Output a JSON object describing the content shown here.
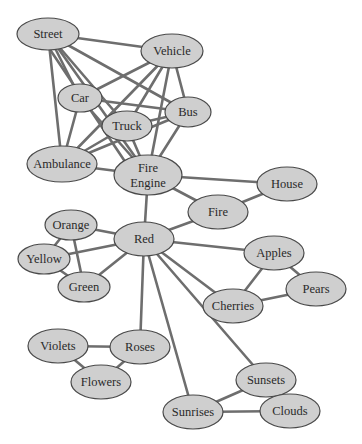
{
  "diagram": {
    "type": "semantic-network",
    "node_fill": "#cfcfcf",
    "node_stroke": "#4a4a4a",
    "edge_color": "#6e6e6e",
    "nodes": [
      {
        "id": "street",
        "label": [
          "Street"
        ],
        "cx": 48,
        "cy": 34,
        "rx": 31,
        "ry": 16
      },
      {
        "id": "vehicle",
        "label": [
          "Vehicle"
        ],
        "cx": 172,
        "cy": 51,
        "rx": 31,
        "ry": 17
      },
      {
        "id": "car",
        "label": [
          "Car"
        ],
        "cx": 80,
        "cy": 98,
        "rx": 22,
        "ry": 14
      },
      {
        "id": "bus",
        "label": [
          "Bus"
        ],
        "cx": 188,
        "cy": 112,
        "rx": 23,
        "ry": 15
      },
      {
        "id": "truck",
        "label": [
          "Truck"
        ],
        "cx": 127,
        "cy": 126,
        "rx": 25,
        "ry": 15
      },
      {
        "id": "ambulance",
        "label": [
          "Ambulance"
        ],
        "cx": 62,
        "cy": 164,
        "rx": 35,
        "ry": 18
      },
      {
        "id": "fire-engine",
        "label": [
          "Fire",
          "Engine"
        ],
        "cx": 148,
        "cy": 175,
        "rx": 34,
        "ry": 20
      },
      {
        "id": "house",
        "label": [
          "House"
        ],
        "cx": 287,
        "cy": 184,
        "rx": 30,
        "ry": 17
      },
      {
        "id": "fire",
        "label": [
          "Fire"
        ],
        "cx": 218,
        "cy": 212,
        "rx": 30,
        "ry": 17
      },
      {
        "id": "orange",
        "label": [
          "Orange"
        ],
        "cx": 71,
        "cy": 225,
        "rx": 26,
        "ry": 15
      },
      {
        "id": "red",
        "label": [
          "Red"
        ],
        "cx": 144,
        "cy": 239,
        "rx": 30,
        "ry": 17
      },
      {
        "id": "yellow",
        "label": [
          "Yellow"
        ],
        "cx": 44,
        "cy": 259,
        "rx": 26,
        "ry": 15
      },
      {
        "id": "green",
        "label": [
          "Green"
        ],
        "cx": 84,
        "cy": 287,
        "rx": 26,
        "ry": 15
      },
      {
        "id": "apples",
        "label": [
          "Apples"
        ],
        "cx": 274,
        "cy": 253,
        "rx": 30,
        "ry": 17
      },
      {
        "id": "pears",
        "label": [
          "Pears"
        ],
        "cx": 316,
        "cy": 289,
        "rx": 30,
        "ry": 17
      },
      {
        "id": "cherries",
        "label": [
          "Cherries"
        ],
        "cx": 233,
        "cy": 306,
        "rx": 30,
        "ry": 17
      },
      {
        "id": "violets",
        "label": [
          "Violets"
        ],
        "cx": 58,
        "cy": 346,
        "rx": 30,
        "ry": 17
      },
      {
        "id": "roses",
        "label": [
          "Roses"
        ],
        "cx": 140,
        "cy": 347,
        "rx": 30,
        "ry": 17
      },
      {
        "id": "flowers",
        "label": [
          "Flowers"
        ],
        "cx": 101,
        "cy": 382,
        "rx": 30,
        "ry": 17
      },
      {
        "id": "sunsets",
        "label": [
          "Sunsets"
        ],
        "cx": 266,
        "cy": 380,
        "rx": 30,
        "ry": 17
      },
      {
        "id": "sunrises",
        "label": [
          "Sunrises"
        ],
        "cx": 193,
        "cy": 412,
        "rx": 30,
        "ry": 17
      },
      {
        "id": "clouds",
        "label": [
          "Clouds"
        ],
        "cx": 290,
        "cy": 411,
        "rx": 30,
        "ry": 17
      }
    ],
    "edges": [
      [
        "street",
        "vehicle"
      ],
      [
        "street",
        "car"
      ],
      [
        "street",
        "bus"
      ],
      [
        "street",
        "truck"
      ],
      [
        "street",
        "ambulance"
      ],
      [
        "street",
        "fire-engine"
      ],
      [
        "street",
        "fire-engine"
      ],
      [
        "vehicle",
        "car"
      ],
      [
        "vehicle",
        "bus"
      ],
      [
        "vehicle",
        "truck"
      ],
      [
        "vehicle",
        "ambulance"
      ],
      [
        "vehicle",
        "fire-engine"
      ],
      [
        "car",
        "bus"
      ],
      [
        "car",
        "ambulance"
      ],
      [
        "car",
        "fire-engine"
      ],
      [
        "truck",
        "bus"
      ],
      [
        "truck",
        "ambulance"
      ],
      [
        "truck",
        "fire-engine"
      ],
      [
        "bus",
        "ambulance"
      ],
      [
        "bus",
        "fire-engine"
      ],
      [
        "ambulance",
        "fire-engine"
      ],
      [
        "fire-engine",
        "house"
      ],
      [
        "fire-engine",
        "fire"
      ],
      [
        "fire-engine",
        "red"
      ],
      [
        "fire",
        "house"
      ],
      [
        "fire",
        "red"
      ],
      [
        "red",
        "orange"
      ],
      [
        "red",
        "yellow"
      ],
      [
        "red",
        "green"
      ],
      [
        "orange",
        "yellow"
      ],
      [
        "orange",
        "green"
      ],
      [
        "yellow",
        "green"
      ],
      [
        "red",
        "apples"
      ],
      [
        "red",
        "cherries"
      ],
      [
        "red",
        "roses"
      ],
      [
        "red",
        "sunrises"
      ],
      [
        "red",
        "sunsets"
      ],
      [
        "apples",
        "pears"
      ],
      [
        "apples",
        "cherries"
      ],
      [
        "cherries",
        "pears"
      ],
      [
        "violets",
        "roses"
      ],
      [
        "violets",
        "flowers"
      ],
      [
        "roses",
        "flowers"
      ],
      [
        "sunsets",
        "sunrises"
      ],
      [
        "sunsets",
        "clouds"
      ],
      [
        "sunrises",
        "clouds"
      ]
    ]
  }
}
